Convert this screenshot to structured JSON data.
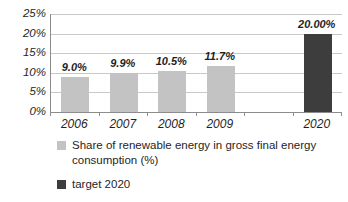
{
  "chart_data": {
    "type": "bar",
    "title": "",
    "xlabel": "",
    "ylabel": "",
    "ylim": [
      0,
      25
    ],
    "y_tick_step": 5,
    "y_tick_labels": [
      "0%",
      "5%",
      "10%",
      "15%",
      "20%",
      "25%"
    ],
    "grid": true,
    "legend_position": "bottom",
    "slots": [
      {
        "category": "2006",
        "value": 9.0,
        "data_label": "9.0%",
        "series": "actual"
      },
      {
        "category": "2007",
        "value": 9.9,
        "data_label": "9.9%",
        "series": "actual"
      },
      {
        "category": "2008",
        "value": 10.5,
        "data_label": "10.5%",
        "series": "actual"
      },
      {
        "category": "2009",
        "value": 11.7,
        "data_label": "11.7%",
        "series": "actual"
      },
      {
        "category": "",
        "value": null,
        "data_label": "",
        "series": null
      },
      {
        "category": "2020",
        "value": 20.0,
        "data_label": "20.00%",
        "series": "target"
      }
    ],
    "series": [
      {
        "id": "actual",
        "name": "Share of renewable energy in gross final energy consumption (%)",
        "color": "#c3c3c3"
      },
      {
        "id": "target",
        "name": "target 2020",
        "color": "#3d3d3d"
      }
    ]
  }
}
